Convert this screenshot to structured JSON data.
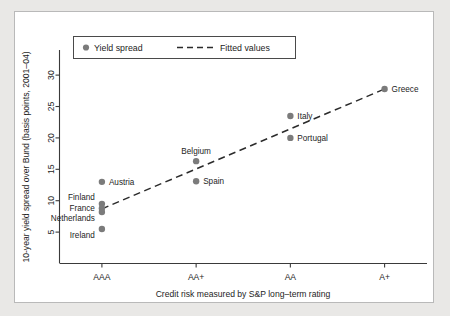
{
  "figure": {
    "background_color": "#ffffff",
    "outer_background_color": "#e9e8e6",
    "border_color": "#b9b9b9"
  },
  "legend": {
    "position": "top-left-inside",
    "items": [
      {
        "label": "Yield spread",
        "marker": "dot",
        "color": "#7b7b7b"
      },
      {
        "label": "Fitted values",
        "marker": "dashed-line",
        "color": "#2b2b2b"
      }
    ]
  },
  "chart_data": {
    "type": "scatter",
    "title": "",
    "subtitle": "",
    "xlabel": "Credit risk measured by S&P long–term rating",
    "ylabel": "10-year yield spread over Bund (basis points, 2001–04)",
    "categories": [
      "AAA",
      "AA+",
      "AA",
      "A+"
    ],
    "xtick_labels": [
      "AAA",
      "AA+",
      "AA",
      "A+"
    ],
    "xtick_values": [
      1,
      2,
      3,
      4
    ],
    "xlim": [
      0.55,
      4.45
    ],
    "ylim": [
      0,
      34
    ],
    "ytick_labels": [
      "5",
      "10",
      "15",
      "20",
      "25",
      "30"
    ],
    "ytick_values": [
      5,
      10,
      15,
      20,
      25,
      30
    ],
    "grid": false,
    "series": [
      {
        "name": "Yield spread",
        "color": "#7b7b7b",
        "marker": "circle",
        "points": [
          {
            "label": "Austria",
            "rating": "AAA",
            "x": 1,
            "y": 13.0,
            "label_pos": "right"
          },
          {
            "label": "Finland",
            "rating": "AAA",
            "x": 1,
            "y": 9.5,
            "label_pos": "left-above"
          },
          {
            "label": "France",
            "rating": "AAA",
            "x": 1,
            "y": 8.8,
            "label_pos": "left"
          },
          {
            "label": "Netherlands",
            "rating": "AAA",
            "x": 1,
            "y": 8.2,
            "label_pos": "left-below"
          },
          {
            "label": "Ireland",
            "rating": "AAA",
            "x": 1,
            "y": 5.5,
            "label_pos": "left-below"
          },
          {
            "label": "Belgium",
            "rating": "AA+",
            "x": 2,
            "y": 16.3,
            "label_pos": "above"
          },
          {
            "label": "Spain",
            "rating": "AA+",
            "x": 2,
            "y": 13.1,
            "label_pos": "right"
          },
          {
            "label": "Italy",
            "rating": "AA",
            "x": 3,
            "y": 23.5,
            "label_pos": "right"
          },
          {
            "label": "Portugal",
            "rating": "AA",
            "x": 3,
            "y": 20.0,
            "label_pos": "right"
          },
          {
            "label": "Greece",
            "rating": "A+",
            "x": 4,
            "y": 27.8,
            "label_pos": "right"
          }
        ]
      },
      {
        "name": "Fitted values",
        "color": "#2b2b2b",
        "marker": "dashed-line",
        "x": [
          1,
          4
        ],
        "y": [
          8.7,
          27.8
        ]
      }
    ]
  }
}
